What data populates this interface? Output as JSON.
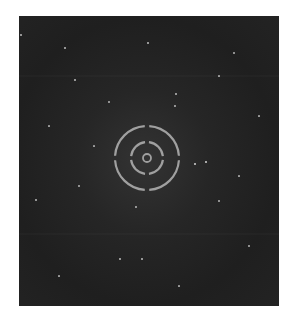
{
  "image": {
    "subject": "starfield with targeting reticle",
    "background_color": "#222222",
    "reticle_color": "#a0a0a0",
    "reticle": {
      "center": [
        128,
        142
      ],
      "outer_radius": 32,
      "middle_radius": 16,
      "inner_radius": 4,
      "gaps": [
        "top",
        "right",
        "bottom",
        "left"
      ]
    },
    "stars": [
      {
        "x": 176,
        "y": 148,
        "r": 1.3
      },
      {
        "x": 187,
        "y": 146,
        "r": 1.3
      },
      {
        "x": 46,
        "y": 32,
        "r": 1
      },
      {
        "x": 129,
        "y": 27,
        "r": 1
      },
      {
        "x": 56,
        "y": 64,
        "r": 1
      },
      {
        "x": 157,
        "y": 78,
        "r": 1
      },
      {
        "x": 156,
        "y": 90,
        "r": 0.9
      },
      {
        "x": 117,
        "y": 191,
        "r": 0.9
      },
      {
        "x": 101,
        "y": 243,
        "r": 1
      },
      {
        "x": 123,
        "y": 243,
        "r": 1
      },
      {
        "x": 17,
        "y": 184,
        "r": 0.8
      },
      {
        "x": 2,
        "y": 19,
        "r": 0.8
      },
      {
        "x": 215,
        "y": 37,
        "r": 0.7
      },
      {
        "x": 90,
        "y": 86,
        "r": 0.7
      },
      {
        "x": 200,
        "y": 185,
        "r": 0.7
      },
      {
        "x": 60,
        "y": 170,
        "r": 0.7
      },
      {
        "x": 230,
        "y": 230,
        "r": 0.7
      },
      {
        "x": 40,
        "y": 260,
        "r": 0.6
      },
      {
        "x": 160,
        "y": 270,
        "r": 0.6
      },
      {
        "x": 240,
        "y": 100,
        "r": 0.6
      },
      {
        "x": 75,
        "y": 130,
        "r": 0.6
      },
      {
        "x": 200,
        "y": 60,
        "r": 0.6
      },
      {
        "x": 30,
        "y": 110,
        "r": 0.6
      },
      {
        "x": 220,
        "y": 160,
        "r": 0.6
      }
    ]
  }
}
